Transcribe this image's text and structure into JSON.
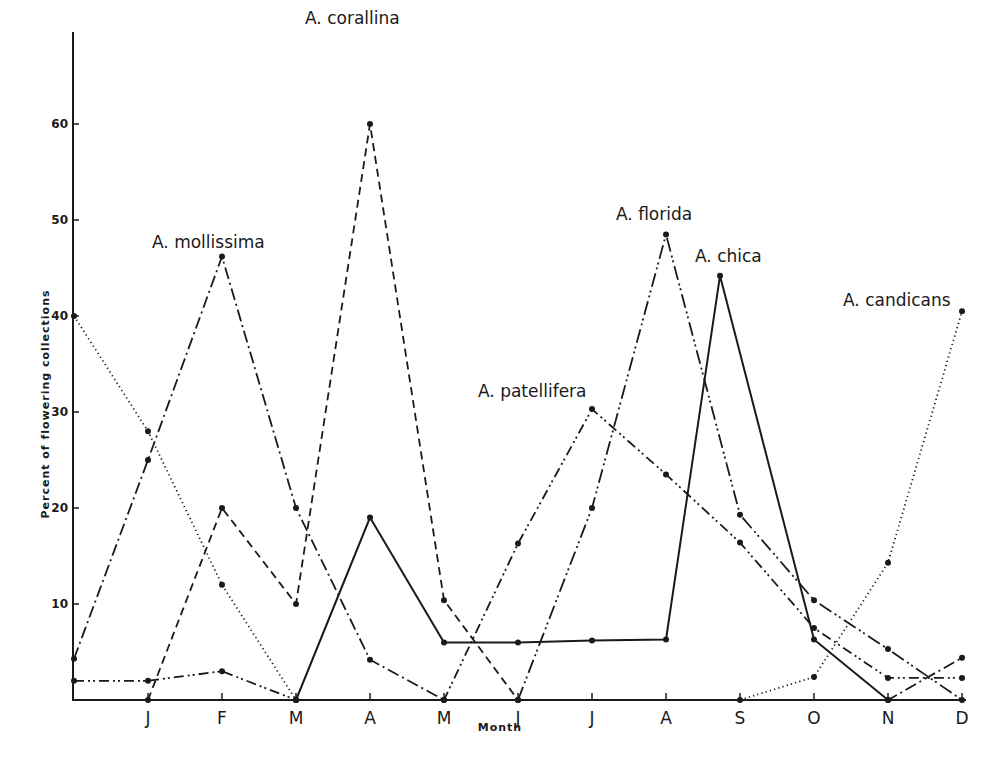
{
  "chart_data": {
    "type": "line",
    "title": "",
    "xlabel": "Month",
    "ylabel": "Percent of flowering collections",
    "ylim": [
      0,
      70
    ],
    "yticks": [
      10,
      20,
      30,
      40,
      50,
      60
    ],
    "grid": false,
    "legend_position": "inline labels near peaks",
    "categories": [
      "",
      "J",
      "F",
      "M",
      "A",
      "M",
      "J",
      "J",
      "A",
      "S",
      "O",
      "N",
      "D"
    ],
    "series": [
      {
        "name": "A. mollissima",
        "style": "dash-dot",
        "points": [
          [
            0,
            4.3
          ],
          [
            1,
            25
          ],
          [
            2,
            46.2
          ],
          [
            3,
            20
          ],
          [
            4,
            4.2
          ],
          [
            5,
            0
          ],
          [
            11,
            0
          ],
          [
            12,
            4.4
          ]
        ],
        "label_pos": [
          152,
          248
        ]
      },
      {
        "name": "A. corallina",
        "style": "dashed",
        "points": [
          [
            1,
            0
          ],
          [
            2,
            20
          ],
          [
            3,
            10
          ],
          [
            4,
            60
          ],
          [
            5,
            10.4
          ],
          [
            6,
            0
          ]
        ],
        "label_pos": [
          305,
          24
        ]
      },
      {
        "name": "A. candicans",
        "style": "dotted",
        "points": [
          [
            0,
            40
          ],
          [
            1,
            28
          ],
          [
            2,
            12
          ],
          [
            3,
            0
          ],
          [
            9,
            0
          ],
          [
            10,
            2.4
          ],
          [
            11,
            14.3
          ],
          [
            12,
            40.5
          ]
        ],
        "label_pos": [
          843,
          306
        ]
      },
      {
        "name": "A. patellifera",
        "style": "dash-dot-dot",
        "points": [
          [
            0,
            2
          ],
          [
            1,
            2
          ],
          [
            2,
            3
          ],
          [
            3,
            0
          ],
          [
            5,
            0
          ],
          [
            6,
            16.3
          ],
          [
            7,
            30.3
          ],
          [
            8,
            23.5
          ],
          [
            9,
            16.4
          ],
          [
            10,
            7.5
          ],
          [
            11,
            2.3
          ],
          [
            12,
            2.3
          ]
        ],
        "label_pos": [
          478,
          397
        ]
      },
      {
        "name": "A. florida",
        "style": "long-dash-dot-dot",
        "points": [
          [
            6,
            0
          ],
          [
            7,
            20
          ],
          [
            8,
            48.5
          ],
          [
            9,
            19.3
          ],
          [
            10,
            10.4
          ],
          [
            11,
            5.3
          ],
          [
            12,
            0
          ]
        ],
        "label_pos": [
          616,
          220
        ]
      },
      {
        "name": "A. chica",
        "style": "solid",
        "points": [
          [
            3,
            0
          ],
          [
            4,
            19
          ],
          [
            5,
            6
          ],
          [
            6,
            6
          ],
          [
            7,
            6.2
          ],
          [
            8,
            6.3
          ],
          [
            8.73,
            44.2
          ],
          [
            10,
            6.3
          ],
          [
            11,
            0
          ]
        ],
        "label_pos": [
          695,
          262
        ]
      }
    ]
  },
  "axes": {
    "x_title": "Month",
    "y_title": "Percent of flowering collections",
    "month_labels": [
      "J",
      "F",
      "M",
      "A",
      "M",
      "J",
      "J",
      "A",
      "S",
      "O",
      "N",
      "D"
    ],
    "y_tick_labels": [
      "10",
      "20",
      "30",
      "40",
      "50",
      "60"
    ]
  },
  "labels": {
    "mollissima": "A. mollissima",
    "corallina": "A. corallina",
    "candicans": "A. candicans",
    "patellifera": "A. patellifera",
    "florida": "A. florida",
    "chica": "A. chica"
  },
  "colors": {
    "ink": "#1a1a1a",
    "background": "#ffffff"
  }
}
